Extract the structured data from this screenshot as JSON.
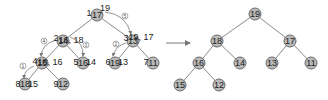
{
  "diagram": {
    "colors": {
      "node_fill": "#b9b9b9",
      "node_stroke": "#6a6a6a",
      "edge": "#8a8a8a"
    },
    "before": {
      "nodes": [
        {
          "index": "1",
          "value": "17",
          "annotation": "19",
          "x": 97,
          "y": 15
        },
        {
          "index": "2",
          "value": "14",
          "annotation": "16, 18",
          "x": 63,
          "y": 41
        },
        {
          "index": "3",
          "value": "13",
          "annotation": "19, 17",
          "x": 133,
          "y": 41
        },
        {
          "index": "4",
          "value": "15",
          "annotation": "18, 16",
          "x": 42,
          "y": 63
        },
        {
          "index": "5",
          "value": "16",
          "annotation": "14",
          "x": 83,
          "y": 63
        },
        {
          "index": "6",
          "value": "19",
          "annotation": "13",
          "x": 115,
          "y": 63
        },
        {
          "index": "7",
          "value": "11",
          "annotation": "",
          "x": 153,
          "y": 63
        },
        {
          "index": "8",
          "value": "18",
          "annotation": "15",
          "x": 25,
          "y": 84
        },
        {
          "index": "9",
          "value": "12",
          "annotation": "",
          "x": 63,
          "y": 84
        }
      ],
      "steps": [
        "①",
        "②",
        "③",
        "④",
        "⑤"
      ]
    },
    "arrow": "→",
    "after": {
      "nodes": [
        {
          "value": "19",
          "x": 255,
          "y": 14
        },
        {
          "value": "18",
          "x": 217,
          "y": 41
        },
        {
          "value": "17",
          "x": 290,
          "y": 41
        },
        {
          "value": "16",
          "x": 199,
          "y": 63
        },
        {
          "value": "14",
          "x": 240,
          "y": 63
        },
        {
          "value": "13",
          "x": 272,
          "y": 63
        },
        {
          "value": "11",
          "x": 311,
          "y": 63
        },
        {
          "value": "15",
          "x": 180,
          "y": 85
        },
        {
          "value": "12",
          "x": 219,
          "y": 85
        }
      ]
    }
  }
}
